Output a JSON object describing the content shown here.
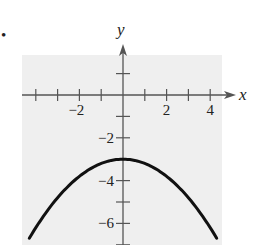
{
  "problem_marker": "•",
  "chart_data": {
    "type": "line",
    "title": "",
    "xlabel": "x",
    "ylabel": "y",
    "xlim": [
      -4.6,
      4.6
    ],
    "ylim": [
      -7,
      2
    ],
    "grid": false,
    "background": "#f0f0f0",
    "x_ticks": [
      -4,
      -3,
      -2,
      -1,
      1,
      2,
      3,
      4
    ],
    "x_tick_labels": [
      {
        "value": -2,
        "text": "−2"
      },
      {
        "value": 2,
        "text": "2"
      },
      {
        "value": 4,
        "text": "4"
      }
    ],
    "y_ticks": [
      1,
      -1,
      -2,
      -3,
      -4,
      -5,
      -6,
      -7
    ],
    "y_tick_labels": [
      {
        "value": -2,
        "text": "−2"
      },
      {
        "value": -4,
        "text": "−4"
      },
      {
        "value": -6,
        "text": "−6"
      }
    ],
    "series": [
      {
        "name": "parabola",
        "equation": "y = -0.2x^2 - 3",
        "vertex": [
          0,
          -3
        ],
        "x": [
          -4.3,
          -4,
          -3,
          -2,
          -1,
          0,
          1,
          2,
          3,
          4,
          4.3
        ],
        "y": [
          -6.7,
          -6.2,
          -4.8,
          -3.8,
          -3.2,
          -3,
          -3.2,
          -3.8,
          -4.8,
          -6.2,
          -6.7
        ]
      }
    ]
  }
}
